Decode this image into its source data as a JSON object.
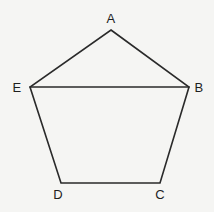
{
  "figure": {
    "name": "pentagon-abcde",
    "background_color": "#f5f5f3",
    "stroke_color": "#2a2a2a",
    "label_color": "#1e1e1e",
    "stroke_width": 1.6,
    "canvas": {
      "width": 214,
      "height": 212
    },
    "shape_type": "pentagon",
    "path": "M 111 30 L 189 87 L 160 183 L 61 183 L 30 87 Z",
    "diagonal_path": "M 30 87 L 189 87",
    "vertices": [
      {
        "id": "A",
        "label": "A",
        "x": 111,
        "y": 30,
        "label_x": 111,
        "label_y": 18
      },
      {
        "id": "B",
        "label": "B",
        "x": 189,
        "y": 87,
        "label_x": 199,
        "label_y": 87
      },
      {
        "id": "C",
        "label": "C",
        "x": 160,
        "y": 183,
        "label_x": 160,
        "label_y": 194
      },
      {
        "id": "D",
        "label": "D",
        "x": 61,
        "y": 183,
        "label_x": 58,
        "label_y": 194
      },
      {
        "id": "E",
        "label": "E",
        "x": 30,
        "y": 87,
        "label_x": 17,
        "label_y": 87
      }
    ],
    "edges": [
      {
        "id": "AB",
        "from": "A",
        "to": "B"
      },
      {
        "id": "BC",
        "from": "B",
        "to": "C"
      },
      {
        "id": "CD",
        "from": "C",
        "to": "D"
      },
      {
        "id": "DE",
        "from": "D",
        "to": "E"
      },
      {
        "id": "EA",
        "from": "E",
        "to": "A"
      },
      {
        "id": "EB",
        "from": "E",
        "to": "B"
      }
    ]
  }
}
